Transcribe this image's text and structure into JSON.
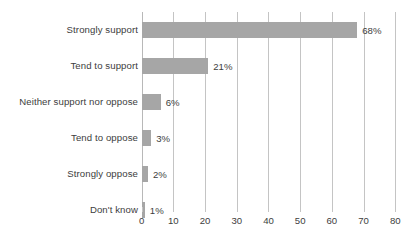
{
  "chart_data": {
    "type": "bar",
    "orientation": "horizontal",
    "title": "",
    "subtitle": "",
    "xlabel": "",
    "ylabel": "",
    "categories": [
      "Strongly support",
      "Tend to support",
      "Neither support nor oppose",
      "Tend to oppose",
      "Strongly oppose",
      "Don't know"
    ],
    "values": [
      68,
      21,
      6,
      3,
      2,
      1
    ],
    "value_labels": [
      "68%",
      "21%",
      "6%",
      "3%",
      "2%",
      "1%"
    ],
    "xlim": [
      0,
      80
    ],
    "xticks": [
      0,
      10,
      20,
      30,
      40,
      50,
      60,
      70,
      80
    ],
    "xtick_labels": [
      "0",
      "10",
      "20",
      "30",
      "40",
      "50",
      "60",
      "70",
      "80"
    ],
    "grid": true,
    "grid_axis": "x",
    "legend": false,
    "legend_position": "none",
    "series": [
      {
        "name": "",
        "values": [
          68,
          21,
          6,
          3,
          2,
          1
        ],
        "color": "#a6a6a6"
      }
    ]
  },
  "style": {
    "bar_color": "#a6a6a6",
    "grid_color": "#c4c4c4",
    "axis_color": "#b8b8b8",
    "text_color": "#3d3d3d",
    "background": "#ffffff"
  }
}
